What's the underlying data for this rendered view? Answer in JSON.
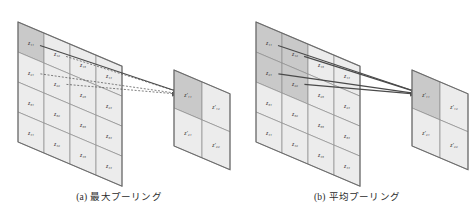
{
  "figure": {
    "panels": [
      {
        "id": "max-pooling",
        "caption_label": "(a)",
        "caption_text": "最大プーリング",
        "input_grid": {
          "rows": 4,
          "cols": 4,
          "cells": [
            [
              "z11",
              "z12",
              "z13",
              "z14"
            ],
            [
              "z21",
              "z22",
              "z23",
              "z24"
            ],
            [
              "z31",
              "z32",
              "z33",
              "z34"
            ],
            [
              "z41",
              "z42",
              "z43",
              "z44"
            ]
          ],
          "labels": [
            [
              "z₁₁",
              "z₁₂",
              "z₁₃",
              "z₁₄"
            ],
            [
              "z₂₁",
              "z₂₂",
              "z₂₃",
              "z₂₄"
            ],
            [
              "z₃₁",
              "z₃₂",
              "z₃₃",
              "z₃₄"
            ],
            [
              "z₄₁",
              "z₄₂",
              "z₄₃",
              "z₄₄"
            ]
          ],
          "highlighted": [
            "z11"
          ],
          "pool_window": [
            "z11",
            "z12",
            "z21",
            "z22"
          ]
        },
        "output_grid": {
          "rows": 2,
          "cols": 2,
          "cells": [
            [
              "zp11",
              "zp12"
            ],
            [
              "zp21",
              "zp22"
            ]
          ],
          "labels": [
            [
              "z′₁₁",
              "z′₁₂"
            ],
            [
              "z′₂₁",
              "z′₂₂"
            ]
          ],
          "highlighted": [
            "zp11"
          ]
        },
        "arrows": [
          {
            "from": "z11",
            "to": "zp11",
            "style": "solid"
          },
          {
            "from": "z12",
            "to": "zp11",
            "style": "dashed"
          },
          {
            "from": "z21",
            "to": "zp11",
            "style": "dashed"
          },
          {
            "from": "z22",
            "to": "zp11",
            "style": "dashed"
          }
        ]
      },
      {
        "id": "average-pooling",
        "caption_label": "(b)",
        "caption_text": "平均プーリング",
        "input_grid": {
          "rows": 4,
          "cols": 4,
          "cells": [
            [
              "z11",
              "z12",
              "z13",
              "z14"
            ],
            [
              "z21",
              "z22",
              "z23",
              "z24"
            ],
            [
              "z31",
              "z32",
              "z33",
              "z34"
            ],
            [
              "z41",
              "z42",
              "z43",
              "z44"
            ]
          ],
          "labels": [
            [
              "z₁₁",
              "z₁₂",
              "z₁₃",
              "z₁₄"
            ],
            [
              "z₂₁",
              "z₂₂",
              "z₂₃",
              "z₂₄"
            ],
            [
              "z₃₁",
              "z₃₂",
              "z₃₃",
              "z₃₄"
            ],
            [
              "z₄₁",
              "z₄₂",
              "z₄₃",
              "z₄₄"
            ]
          ],
          "highlighted": [
            "z11",
            "z12",
            "z21",
            "z22"
          ],
          "pool_window": [
            "z11",
            "z12",
            "z21",
            "z22"
          ]
        },
        "output_grid": {
          "rows": 2,
          "cols": 2,
          "cells": [
            [
              "zp11",
              "zp12"
            ],
            [
              "zp21",
              "zp22"
            ]
          ],
          "labels": [
            [
              "z′₁₁",
              "z′₁₂"
            ],
            [
              "z′₂₁",
              "z′₂₂"
            ]
          ],
          "highlighted": [
            "zp11"
          ]
        },
        "arrows": [
          {
            "from": "z11",
            "to": "zp11",
            "style": "solid"
          },
          {
            "from": "z12",
            "to": "zp11",
            "style": "solid"
          },
          {
            "from": "z21",
            "to": "zp11",
            "style": "solid"
          },
          {
            "from": "z22",
            "to": "zp11",
            "style": "solid"
          }
        ]
      }
    ],
    "colors": {
      "background": "#ffffff",
      "cell_fill": "#ececec",
      "cell_fill_highlight": "#c9c9c9",
      "cell_stroke": "#8d8d8d",
      "plane_border": "#6b6b6b",
      "arrow": "#4a4a4a",
      "text": "#2b2b2b"
    },
    "geometry": {
      "input_cell_w": 26,
      "input_cell_h": 30,
      "output_cell_w": 28,
      "output_cell_h": 38,
      "shear_deg": 23
    }
  }
}
